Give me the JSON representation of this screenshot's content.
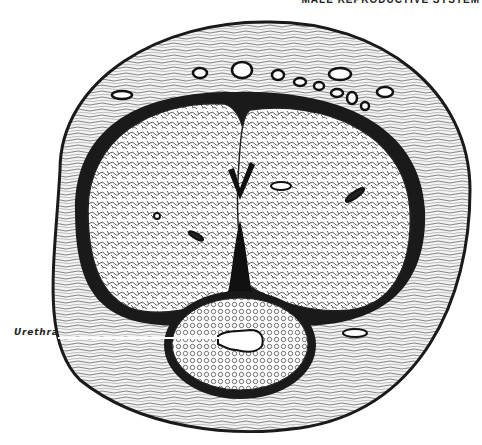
{
  "header": {
    "running_title": "MALE REPRODUCTIVE SYSTEM"
  },
  "figure": {
    "colors": {
      "ink": "#1a1a1a",
      "paper": "#ffffff",
      "tissue_light": "#e8e8e8"
    },
    "labels": [
      {
        "id": "urethra",
        "text": "Urethra"
      }
    ]
  }
}
